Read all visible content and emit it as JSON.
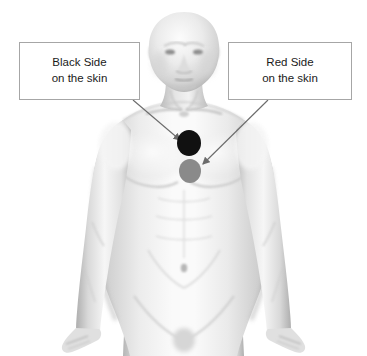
{
  "figure": {
    "type": "anatomical-illustration",
    "background_color": "#ffffff",
    "skin_tone_light": "#f2f2f2",
    "skin_tone_mid": "#d8d8d8",
    "skin_tone_shadow": "#b0b0b0",
    "outline_color": "#9a9a9a"
  },
  "callouts": [
    {
      "id": "black-side",
      "line1": "Black Side",
      "line2": "on the skin",
      "border_color": "#a6a6a6",
      "text_color": "#1a1a1a",
      "points_to": "black-electrode"
    },
    {
      "id": "red-side",
      "line1": "Red Side",
      "line2": "on the skin",
      "border_color": "#a6a6a6",
      "text_color": "#1a1a1a",
      "points_to": "red-electrode"
    }
  ],
  "electrodes": [
    {
      "id": "black-electrode",
      "label": "Black Side",
      "color": "#111111",
      "position": "upper chest, midline, above the red electrode",
      "cx": 189,
      "cy": 143,
      "rx": 12,
      "ry": 13
    },
    {
      "id": "red-electrode",
      "label": "Red Side",
      "color": "#8a8a8a",
      "position": "chest, midline, below the black electrode",
      "cx": 190,
      "cy": 171,
      "rx": 11,
      "ry": 12
    }
  ],
  "arrows": [
    {
      "id": "arrow-black",
      "from": "black-side callout bottom-right corner",
      "to": "black-electrode",
      "x1": 133,
      "y1": 100,
      "x2": 180,
      "y2": 140,
      "color": "#6b6b6b"
    },
    {
      "id": "arrow-red",
      "from": "red-side callout bottom-left corner",
      "to": "red-electrode",
      "x1": 268,
      "y1": 100,
      "x2": 203,
      "y2": 164,
      "color": "#6b6b6b"
    }
  ]
}
